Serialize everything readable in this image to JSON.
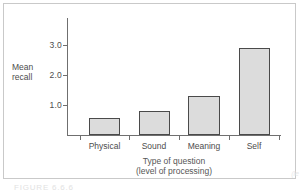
{
  "figure": {
    "caption": "FIGURE 6.6.6",
    "corner_mark": "(le"
  },
  "chart_data": {
    "type": "bar",
    "title": "",
    "subtitle": "",
    "categories": [
      "Physical",
      "Sound",
      "Meaning",
      "Self"
    ],
    "values": [
      0.55,
      0.8,
      1.3,
      2.9
    ],
    "series": [
      {
        "name": "Mean recall",
        "values": [
          0.55,
          0.8,
          1.3,
          2.9
        ]
      }
    ],
    "xlabel": "Type of question",
    "xlabel_line2": "(level of processing)",
    "ylabel": "Mean",
    "ylabel_line2": "recall",
    "ylim": [
      0,
      3.7
    ],
    "yticks": [
      1.0,
      2.0,
      3.0
    ],
    "ytick_labels": [
      "1.0",
      "2.0",
      "3.0"
    ],
    "grid": false,
    "legend": "none",
    "bar_fill_color": "#dcdcdc",
    "bar_edge_color": "#4a4a4a",
    "axis_color": "#6f6f6f",
    "background_color": "#ffffff"
  }
}
